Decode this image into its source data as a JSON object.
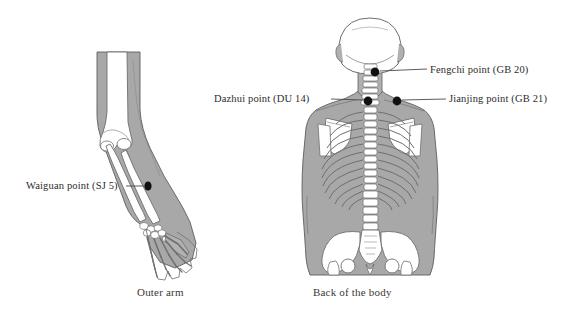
{
  "figure": {
    "background_color": "#ffffff",
    "ink_color": "#2e2b2a",
    "skin_fill": "#a8a8a8",
    "bone_fill": "#ffffff",
    "bone_stroke": "#6e6e6e",
    "marker_color": "#111111",
    "leader_color": "#4a4a4a"
  },
  "panels": [
    {
      "id": "outer-arm",
      "caption": "Outer arm",
      "points": [
        {
          "id": "waiguan",
          "label": "Waiguan point (SJ 5)",
          "meridian": "SJ",
          "number": "5",
          "marker_x": 148,
          "marker_y": 186,
          "leader_from_x": 136,
          "leader_from_y": 186,
          "leader_to_x": 144,
          "leader_to_y": 186
        }
      ]
    },
    {
      "id": "back-of-body",
      "caption": "Back of the body",
      "points": [
        {
          "id": "fengchi",
          "label": "Fengchi point (GB 20)",
          "meridian": "GB",
          "number": "20",
          "marker_x": 375,
          "marker_y": 72,
          "leader_from_x": 379,
          "leader_from_y": 71,
          "leader_to_x": 426,
          "leader_to_y": 69
        },
        {
          "id": "dazhui",
          "label": "Dazhui point (DU 14)",
          "meridian": "DU",
          "number": "14",
          "marker_x": 368,
          "marker_y": 101,
          "leader_from_x": 331,
          "leader_from_y": 99,
          "leader_to_x": 364,
          "leader_to_y": 100
        },
        {
          "id": "jianjing",
          "label": "Jianjing point (GB 21)",
          "meridian": "GB",
          "number": "21",
          "marker_x": 397,
          "marker_y": 101,
          "leader_from_x": 401,
          "leader_from_y": 100,
          "leader_to_x": 445,
          "leader_to_y": 99
        }
      ]
    }
  ],
  "labels": {
    "waiguan": "Waiguan point (SJ 5)",
    "fengchi": "Fengchi point (GB 20)",
    "dazhui": "Dazhui point (DU 14)",
    "jianjing": "Jianjing point (GB 21)"
  },
  "captions": {
    "arm": "Outer arm",
    "body": "Back of the body"
  }
}
